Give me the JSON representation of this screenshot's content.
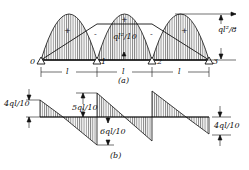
{
  "figure": {
    "moment_diagram": {
      "caption": "(a)",
      "support_labels": [
        "0",
        "1",
        "2",
        "3"
      ],
      "span_labels": [
        "l",
        "l",
        "l"
      ],
      "sign_labels": [
        "+",
        "-",
        "+",
        "-",
        "+"
      ],
      "midspan_label": "ql²/8",
      "support_moment_label": "ql²/10"
    },
    "shear_diagram": {
      "caption": "(b)",
      "labels": {
        "left_end": "4ql/10",
        "support1_left": "6ql/10",
        "support1_right": "5ql/10",
        "right_end": "4ql/10"
      }
    },
    "colors": {
      "ink": "#111111",
      "background": "#ffffff"
    }
  }
}
